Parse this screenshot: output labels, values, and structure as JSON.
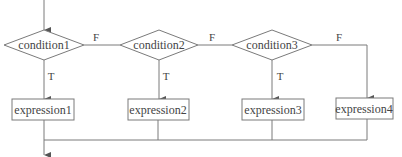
{
  "diagram": {
    "type": "flowchart",
    "line_color": "#7a7a7a",
    "text_color": "#444444",
    "conditions": [
      {
        "id": "c1",
        "label": "condition1",
        "cx": 44,
        "cy": 45,
        "w": 80,
        "h": 30
      },
      {
        "id": "c2",
        "label": "condition2",
        "cx": 159,
        "cy": 45,
        "w": 78,
        "h": 30
      },
      {
        "id": "c3",
        "label": "condition3",
        "cx": 272,
        "cy": 45,
        "w": 80,
        "h": 30
      }
    ],
    "expressions": [
      {
        "id": "e1",
        "label": "expression1",
        "x": 12,
        "y": 99,
        "w": 62,
        "h": 21
      },
      {
        "id": "e2",
        "label": "expression2",
        "x": 128,
        "y": 99,
        "w": 61,
        "h": 21
      },
      {
        "id": "e3",
        "label": "expression3",
        "x": 242,
        "y": 99,
        "w": 62,
        "h": 21
      },
      {
        "id": "e4",
        "label": "expression4",
        "x": 336,
        "y": 98,
        "w": 57,
        "h": 21
      }
    ],
    "edge_labels": {
      "true": "T",
      "false": "F"
    },
    "edges": [
      {
        "from": "start",
        "to": "c1"
      },
      {
        "from": "c1",
        "to": "e1",
        "label": "T"
      },
      {
        "from": "c1",
        "to": "c2",
        "label": "F"
      },
      {
        "from": "c2",
        "to": "e2",
        "label": "T"
      },
      {
        "from": "c2",
        "to": "c3",
        "label": "F"
      },
      {
        "from": "c3",
        "to": "e3",
        "label": "T"
      },
      {
        "from": "c3",
        "to": "e4",
        "label": "F"
      },
      {
        "from": "e1",
        "to": "merge"
      },
      {
        "from": "e2",
        "to": "merge"
      },
      {
        "from": "e3",
        "to": "merge"
      },
      {
        "from": "e4",
        "to": "merge"
      },
      {
        "from": "merge",
        "to": "end"
      }
    ]
  }
}
